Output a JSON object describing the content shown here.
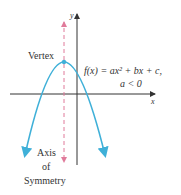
{
  "diagram": {
    "labels": {
      "y_axis": "y",
      "x_axis": "x",
      "vertex": "Vertex",
      "equation": "f(x) = ax² + bx + c,",
      "condition": "a < 0",
      "axis_line1": "Axis",
      "axis_line2": "of",
      "axis_line3": "Symmetry"
    },
    "colors": {
      "curve": "#3fb0d8",
      "symmetry_line": "#e07a9a",
      "axes": "#333333"
    }
  }
}
